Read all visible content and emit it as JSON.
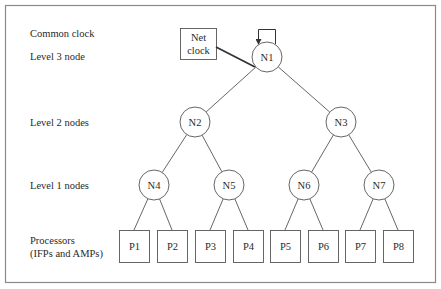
{
  "diagram": {
    "type": "tree",
    "labels": {
      "common_clock": "Common clock",
      "level3": "Level 3 node",
      "level2": "Level 2 nodes",
      "level1": "Level 1 nodes",
      "processors_line1": "Processors",
      "processors_line2": "(IFPs and AMPs)"
    },
    "net_clock": {
      "line1": "Net",
      "line2": "clock"
    },
    "nodes": [
      {
        "id": "N1",
        "label": "N1",
        "level": 3,
        "cx": 267,
        "cy": 57,
        "parent": null
      },
      {
        "id": "N2",
        "label": "N2",
        "level": 2,
        "cx": 195,
        "cy": 122,
        "parent": "N1"
      },
      {
        "id": "N3",
        "label": "N3",
        "level": 2,
        "cx": 341,
        "cy": 122,
        "parent": "N1"
      },
      {
        "id": "N4",
        "label": "N4",
        "level": 1,
        "cx": 154,
        "cy": 185,
        "parent": "N2"
      },
      {
        "id": "N5",
        "label": "N5",
        "level": 1,
        "cx": 229,
        "cy": 185,
        "parent": "N2"
      },
      {
        "id": "N6",
        "label": "N6",
        "level": 1,
        "cx": 304,
        "cy": 185,
        "parent": "N3"
      },
      {
        "id": "N7",
        "label": "N7",
        "level": 1,
        "cx": 379,
        "cy": 185,
        "parent": "N3"
      }
    ],
    "processors": [
      {
        "id": "P1",
        "label": "P1",
        "x": 119,
        "parent": "N4"
      },
      {
        "id": "P2",
        "label": "P2",
        "x": 157,
        "parent": "N4"
      },
      {
        "id": "P3",
        "label": "P3",
        "x": 195,
        "parent": "N5"
      },
      {
        "id": "P4",
        "label": "P4",
        "x": 233,
        "parent": "N5"
      },
      {
        "id": "P5",
        "label": "P5",
        "x": 270,
        "parent": "N6"
      },
      {
        "id": "P6",
        "label": "P6",
        "x": 308,
        "parent": "N6"
      },
      {
        "id": "P7",
        "label": "P7",
        "x": 345,
        "parent": "N7"
      },
      {
        "id": "P8",
        "label": "P8",
        "x": 383,
        "parent": "N7"
      }
    ],
    "colors": {
      "stroke": "#555555",
      "frame": "#8a8a8a",
      "text": "#2a2a2a",
      "background": "#ffffff"
    }
  }
}
